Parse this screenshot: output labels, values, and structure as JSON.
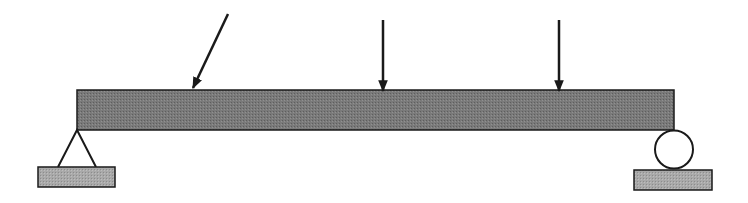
{
  "diagram": {
    "type": "simply-supported-beam",
    "colors": {
      "background": "#ffffff",
      "beam_fill": "#777777",
      "plate_fill": "#a8a8a8",
      "stroke": "#1a1a1a"
    },
    "beam": {
      "x": 77,
      "y": 90,
      "width": 597,
      "height": 40,
      "label": "beam"
    },
    "supports": [
      {
        "kind": "pin",
        "label": "pin-support",
        "apex": [
          77,
          130
        ],
        "base_left": [
          58,
          167
        ],
        "base_right": [
          96,
          167
        ],
        "plate": {
          "x": 38,
          "y": 167,
          "width": 77,
          "height": 20
        }
      },
      {
        "kind": "roller",
        "label": "roller-support",
        "circle": {
          "cx": 674,
          "cy": 149,
          "r": 19
        },
        "plate": {
          "x": 634,
          "y": 170,
          "width": 78,
          "height": 20
        }
      }
    ],
    "loads": [
      {
        "kind": "inclined",
        "label": "inclined-load",
        "from": [
          228,
          14
        ],
        "to": [
          192,
          90
        ]
      },
      {
        "kind": "vertical",
        "label": "vertical-load-1",
        "from": [
          383,
          20
        ],
        "to": [
          383,
          92
        ]
      },
      {
        "kind": "vertical",
        "label": "vertical-load-2",
        "from": [
          559,
          20
        ],
        "to": [
          559,
          92
        ]
      }
    ]
  }
}
